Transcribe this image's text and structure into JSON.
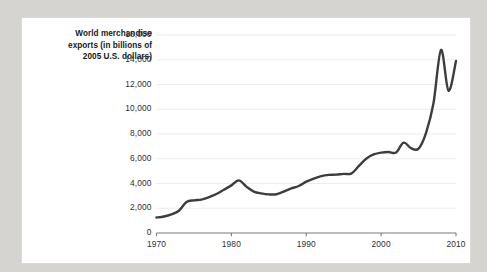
{
  "figure": {
    "background_color": "#d6d4d1",
    "panel_color": "#ffffff",
    "line_color": "#3d3d3d",
    "grid_color": "#ececed",
    "axis_color": "#7a7a7a"
  },
  "chart_data": {
    "type": "line",
    "title": "",
    "ylabel": "World merchandise exports (in billions of 2005 U.S. dollars)",
    "ylabel_lines": [
      "World merchandise",
      "exports (in billions of",
      "2005 U.S. dollars)"
    ],
    "xlabel": "",
    "xlim": [
      1970,
      2010
    ],
    "ylim": [
      0,
      16000
    ],
    "xticks": [
      1970,
      1980,
      1990,
      2000,
      2010
    ],
    "xtick_labels": [
      "1970",
      "1980",
      "1990",
      "2000",
      "2010"
    ],
    "yticks": [
      0,
      2000,
      4000,
      6000,
      8000,
      10000,
      12000,
      14000,
      16000
    ],
    "ytick_labels": [
      "0",
      "2,000",
      "4,000",
      "6,000",
      "8,000",
      "10,000",
      "12,000",
      "14,000",
      "16,000"
    ],
    "grid": "horizontal",
    "legend": "none",
    "series": [
      {
        "name": "World merchandise exports",
        "x": [
          1970,
          1971,
          1972,
          1973,
          1974,
          1975,
          1976,
          1977,
          1978,
          1979,
          1980,
          1981,
          1982,
          1983,
          1984,
          1985,
          1986,
          1987,
          1988,
          1989,
          1990,
          1991,
          1992,
          1993,
          1994,
          1995,
          1996,
          1997,
          1998,
          1999,
          2000,
          2001,
          2002,
          2003,
          2004,
          2005,
          2006,
          2007,
          2008,
          2009,
          2010
        ],
        "values": [
          1250,
          1330,
          1500,
          1800,
          2500,
          2640,
          2700,
          2900,
          3150,
          3500,
          3850,
          4250,
          3750,
          3350,
          3200,
          3120,
          3130,
          3350,
          3600,
          3800,
          4150,
          4400,
          4600,
          4700,
          4720,
          4780,
          4800,
          5400,
          6000,
          6350,
          6500,
          6550,
          6500,
          7300,
          6850,
          6820,
          8100,
          10500,
          14800,
          11500,
          13900
        ]
      }
    ]
  }
}
